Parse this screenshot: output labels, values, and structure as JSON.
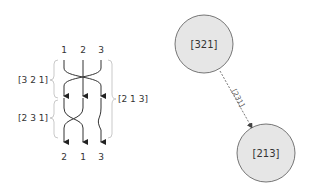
{
  "braid": {
    "top_labels": [
      "1",
      "2",
      "3"
    ],
    "bottom_labels": [
      "2",
      "1",
      "3"
    ],
    "left_brackets": [
      "[3 2 1]",
      "[2 3 1]"
    ],
    "right_bracket": "[2 1 3]"
  },
  "graph": {
    "nodes": [
      {
        "label": "[321]"
      },
      {
        "label": "[213]"
      }
    ],
    "edge_label": "[231]",
    "colors": {
      "node_fill": "#e6e6e6",
      "node_stroke": "#555555",
      "edge": "#555555"
    }
  }
}
